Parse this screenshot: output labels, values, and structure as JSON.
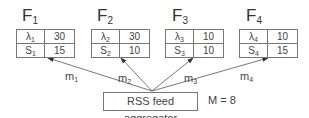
{
  "feeds": [
    {
      "name": "F",
      "index": "1",
      "lambda_sym": "λ",
      "lambda_idx": "1",
      "lambda": "30",
      "s_sym": "S",
      "s_idx": "1",
      "s": "15",
      "edge": "m",
      "edge_idx": "1"
    },
    {
      "name": "F",
      "index": "2",
      "lambda_sym": "λ",
      "lambda_idx": "2",
      "lambda": "30",
      "s_sym": "S",
      "s_idx": "2",
      "s": "10",
      "edge": "m",
      "edge_idx": "2"
    },
    {
      "name": "F",
      "index": "3",
      "lambda_sym": "λ",
      "lambda_idx": "3",
      "lambda": "10",
      "s_sym": "S",
      "s_idx": "3",
      "s": "10",
      "edge": "m",
      "edge_idx": "3"
    },
    {
      "name": "F",
      "index": "4",
      "lambda_sym": "λ",
      "lambda_idx": "4",
      "lambda": "10",
      "s_sym": "S",
      "s_idx": "4",
      "s": "15",
      "edge": "m",
      "edge_idx": "4"
    }
  ],
  "aggregator": {
    "label": "RSS feed aggregator",
    "constraint": "M = 8"
  },
  "colors": {
    "stroke": "#555555",
    "text": "#333333"
  }
}
